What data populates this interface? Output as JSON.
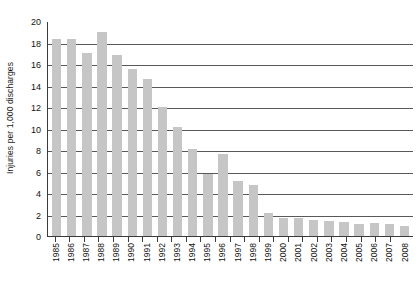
{
  "chart_data": {
    "type": "bar",
    "title": "",
    "subtitle": "",
    "xlabel": "",
    "ylabel": "Injuries per 1,000 discharges",
    "ylim": [
      0,
      20
    ],
    "yticks": [
      0,
      2,
      4,
      6,
      8,
      10,
      12,
      14,
      16,
      18,
      20
    ],
    "grid": "horizontal",
    "legend": "none",
    "bar_color": "#c6c6c6",
    "axis_color": "#3b3b3b",
    "gridline_color": "#58595b",
    "categories": [
      "1985",
      "1986",
      "1987",
      "1988",
      "1989",
      "1990",
      "1991",
      "1992",
      "1993",
      "1994",
      "1995",
      "1996",
      "1997",
      "1998",
      "1999",
      "2000",
      "2001",
      "2002",
      "2003",
      "2004",
      "2005",
      "2006",
      "2007",
      "2008"
    ],
    "values": [
      18.3,
      18.3,
      17.0,
      19.0,
      16.8,
      15.5,
      14.6,
      12.0,
      10.1,
      8.1,
      5.8,
      7.6,
      5.1,
      4.7,
      2.1,
      1.7,
      1.7,
      1.5,
      1.4,
      1.3,
      1.1,
      1.2,
      1.1,
      0.9
    ],
    "series": [
      {
        "name": "Injuries per 1,000 discharges",
        "values": [
          18.3,
          18.3,
          17.0,
          19.0,
          16.8,
          15.5,
          14.6,
          12.0,
          10.1,
          8.1,
          5.8,
          7.6,
          5.1,
          4.7,
          2.1,
          1.7,
          1.7,
          1.5,
          1.4,
          1.3,
          1.1,
          1.2,
          1.1,
          0.9
        ]
      }
    ]
  }
}
